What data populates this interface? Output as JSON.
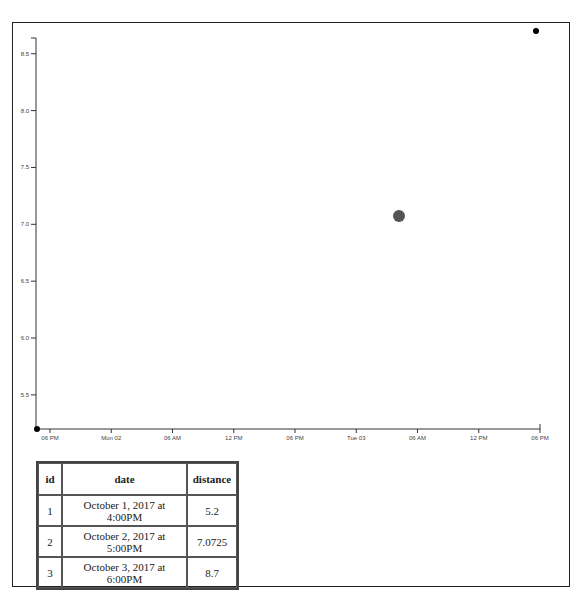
{
  "chart_data": {
    "type": "scatter",
    "title": "",
    "xlabel": "",
    "ylabel": "",
    "x_tick_labels": [
      "06 PM",
      "Mon 02",
      "06 AM",
      "12 PM",
      "06 PM",
      "Tue 03",
      "06 AM",
      "12 PM",
      "06 PM"
    ],
    "y_tick_labels": [
      "5.5",
      "6.0",
      "6.5",
      "7.0",
      "7.5",
      "8.0",
      "8.5"
    ],
    "ylim": [
      5.2,
      8.8
    ],
    "grid": false,
    "points": [
      {
        "id": 1,
        "x": "October 1, 2017 at 4:00PM",
        "y": 5.2,
        "color": "#000000",
        "radius": 3
      },
      {
        "id": 2,
        "x": "October 2, 2017 at 5:00PM",
        "y": 7.0725,
        "color": "#555555",
        "radius": 6
      },
      {
        "id": 3,
        "x": "October 3, 2017 at 6:00PM",
        "y": 8.7,
        "color": "#000000",
        "radius": 3
      }
    ]
  },
  "table": {
    "headers": {
      "id": "id",
      "date": "date",
      "distance": "distance"
    },
    "rows": [
      {
        "id": "1",
        "date": "October 1, 2017 at 4:00PM",
        "distance": "5.2"
      },
      {
        "id": "2",
        "date": "October 2, 2017 at 5:00PM",
        "distance": "7.0725"
      },
      {
        "id": "3",
        "date": "October 3, 2017 at 6:00PM",
        "distance": "8.7"
      }
    ]
  }
}
